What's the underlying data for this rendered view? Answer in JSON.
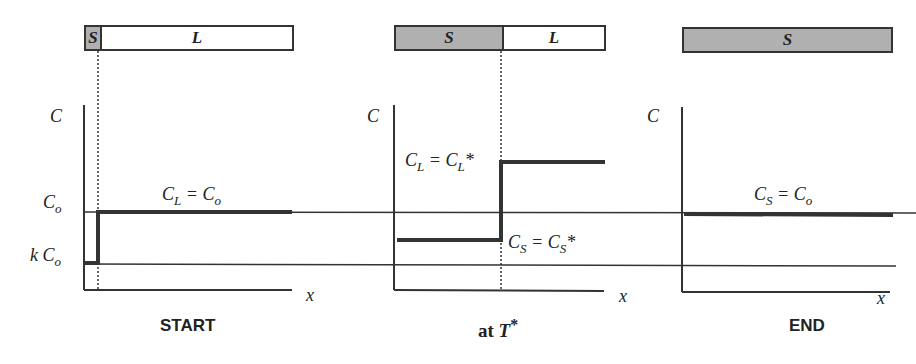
{
  "panels": [
    {
      "caption": "START",
      "bar": [
        {
          "phase": "S",
          "state": "solid"
        },
        {
          "phase": "L",
          "state": "liquid"
        }
      ],
      "label": "C_L = C_o"
    },
    {
      "caption": "at T*",
      "bar": [
        {
          "phase": "S",
          "state": "solid"
        },
        {
          "phase": "L",
          "state": "liquid"
        }
      ],
      "labels": [
        "C_L = C_L*",
        "C_S = C_S*"
      ]
    },
    {
      "caption": "END",
      "bar": [
        {
          "phase": "S",
          "state": "solid"
        }
      ],
      "label": "C_S = C_o"
    }
  ],
  "axes": {
    "y_label": "C",
    "x_label": "x",
    "levels": [
      "C_o",
      "k C_o"
    ]
  },
  "text": {
    "s": "S",
    "l": "L",
    "c": "C",
    "x": "x",
    "co": "C",
    "co_sub": "o",
    "k": "k C",
    "k_sub": "o",
    "start": "START",
    "at": "at ",
    "t": "T",
    "star": "*",
    "end": "END",
    "cl": "C",
    "l_sub": "L",
    "eq": " = ",
    "s_sub": "S",
    "o_sub": "o"
  },
  "colors": {
    "solid_fill": "#b0b0b0",
    "line": "#333333"
  }
}
